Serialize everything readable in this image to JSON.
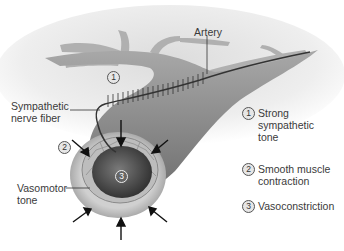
{
  "diagram": {
    "title_labels": {
      "artery": "Artery",
      "sympathetic_nerve_fiber_line1": "Sympathetic",
      "sympathetic_nerve_fiber_line2": "nerve fiber",
      "vasomotor_tone_line1": "Vasomotor",
      "vasomotor_tone_line2": "tone"
    },
    "markers": {
      "m1": "1",
      "m2": "2",
      "m3": "3"
    },
    "legend": [
      {
        "num": "1",
        "line1": "Strong",
        "line2": "sympathetic",
        "line3": "tone"
      },
      {
        "num": "2",
        "line1": "Smooth muscle",
        "line2": "contraction"
      },
      {
        "num": "3",
        "line1": "Vasoconstriction"
      }
    ],
    "colors": {
      "vessel": "#8a8a8a",
      "vessel_light": "#c4c4c4",
      "lumen": "#4a4a4a",
      "background_haze": "#e8e8e8"
    }
  }
}
